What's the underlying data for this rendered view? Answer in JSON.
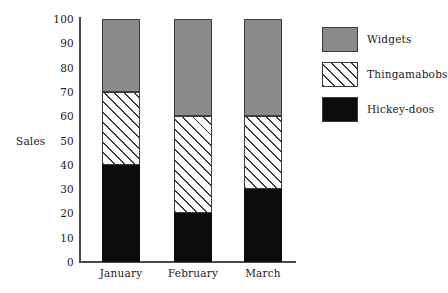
{
  "chart_data": {
    "type": "bar",
    "subtype": "stacked-bar",
    "title": "",
    "xlabel": "",
    "ylabel": "Sales",
    "categories": [
      "January",
      "February",
      "March"
    ],
    "series": [
      {
        "name": "Hickey-doos",
        "values": [
          40,
          20,
          30
        ],
        "fill": "solid-black",
        "color": "#0b0b0b"
      },
      {
        "name": "Thingamabobs",
        "values": [
          30,
          40,
          30
        ],
        "fill": "diagonal-hatch",
        "color": "#ffffff"
      },
      {
        "name": "Widgets",
        "values": [
          30,
          40,
          40
        ],
        "fill": "solid-gray",
        "color": "#8a8a8a"
      }
    ],
    "stack_tops": {
      "January": {
        "Hickey-doos": 40,
        "Thingamabobs": 70,
        "Widgets": 100
      },
      "February": {
        "Hickey-doos": 20,
        "Thingamabobs": 60,
        "Widgets": 100
      },
      "March": {
        "Hickey-doos": 30,
        "Thingamabobs": 60,
        "Widgets": 100
      }
    },
    "ylim": [
      0,
      100
    ],
    "ytick_step": 10,
    "yticks": [
      "100",
      "90",
      "80",
      "70",
      "60",
      "50",
      "40",
      "30",
      "20",
      "10",
      "0"
    ],
    "grid": false,
    "legend_position": "right",
    "legend_order": [
      "Widgets",
      "Thingamabobs",
      "Hickey-doos"
    ]
  },
  "axes": {
    "y_label": "Sales",
    "y_ticks": [
      {
        "value": 100,
        "label": "100"
      },
      {
        "value": 90,
        "label": "90"
      },
      {
        "value": 80,
        "label": "80"
      },
      {
        "value": 70,
        "label": "70"
      },
      {
        "value": 60,
        "label": "60"
      },
      {
        "value": 50,
        "label": "50"
      },
      {
        "value": 40,
        "label": "40"
      },
      {
        "value": 30,
        "label": "30"
      },
      {
        "value": 20,
        "label": "20"
      },
      {
        "value": 10,
        "label": "10"
      },
      {
        "value": 0,
        "label": "0"
      }
    ],
    "x_ticks": [
      {
        "label": "January"
      },
      {
        "label": "February"
      },
      {
        "label": "March"
      }
    ]
  },
  "legend": {
    "entries": [
      {
        "label": "Widgets",
        "fill": "solid-gray"
      },
      {
        "label": "Thingamabobs",
        "fill": "diagonal-hatch"
      },
      {
        "label": "Hickey-doos",
        "fill": "solid-black"
      }
    ]
  },
  "colors": {
    "widgets_gray": "#8a8a8a",
    "hickeydoos_black": "#0b0b0b",
    "thingamabobs_white": "#ffffff",
    "hatch_line": "#3c3c3c",
    "axis": "#4a4a4a",
    "text": "#1a1a1a",
    "background": "#ffffff"
  }
}
